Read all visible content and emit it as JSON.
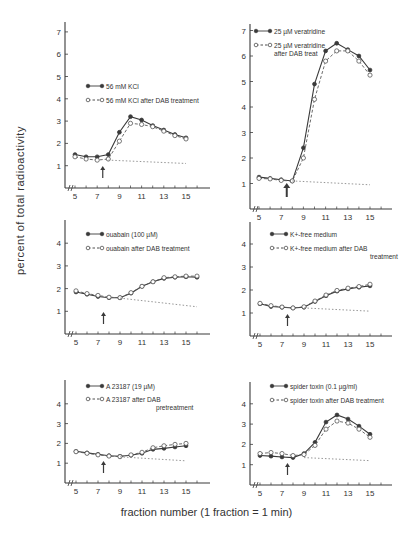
{
  "figure": {
    "ylabel": "percent of total radioactivity",
    "xlabel": "fraction number (1 fraction = 1 min)"
  },
  "chart_data": [
    {
      "type": "line",
      "id": "kcl",
      "panel": "top-left",
      "xlabel": "fraction number (1 fraction = 1 min)",
      "ylabel": "percent of total radioactivity",
      "xticks": [
        5,
        7,
        9,
        11,
        13,
        15
      ],
      "yticks": [
        1,
        2,
        3,
        4,
        5,
        6,
        7
      ],
      "ylim": [
        0,
        7
      ],
      "xlim": [
        4.5,
        17
      ],
      "stimulus_arrow_x": 7.5,
      "x": [
        5,
        6,
        7,
        8,
        9,
        10,
        11,
        12,
        13,
        14,
        15
      ],
      "series": [
        {
          "name": "56 mM KCl",
          "style": "solid-filled",
          "values": [
            1.5,
            1.4,
            1.4,
            1.5,
            2.5,
            3.2,
            3.05,
            2.8,
            2.6,
            2.4,
            2.25
          ]
        },
        {
          "name": "56 mM KCl after DAB treatment",
          "style": "dashed-open",
          "values": [
            1.4,
            1.3,
            1.25,
            1.3,
            2.1,
            2.9,
            2.85,
            2.75,
            2.55,
            2.35,
            2.2
          ]
        },
        {
          "name": "baseline",
          "style": "dotted",
          "points": [
            [
              8,
              1.25
            ],
            [
              15,
              1.1
            ]
          ]
        }
      ],
      "legend": [
        "56 mM KCl",
        "56 mM KCl after DAB treatment"
      ]
    },
    {
      "type": "line",
      "id": "veratridine",
      "panel": "top-right",
      "xticks": [
        5,
        7,
        9,
        11,
        13,
        15
      ],
      "yticks": [
        1,
        2,
        3,
        4,
        5,
        6,
        7
      ],
      "ylim": [
        0,
        7
      ],
      "xlim": [
        4.5,
        17
      ],
      "stimulus_arrow_x": 7.5,
      "x": [
        5,
        6,
        7,
        8,
        9,
        10,
        11,
        12,
        13,
        14,
        15
      ],
      "series": [
        {
          "name": "25 µM veratridine",
          "style": "solid-filled",
          "values": [
            1.25,
            1.2,
            1.15,
            1.1,
            2.4,
            4.9,
            6.2,
            6.5,
            6.25,
            6.0,
            5.45
          ]
        },
        {
          "name": "25 µM veratridine after DAB treat",
          "style": "dashed-open",
          "values": [
            1.2,
            1.18,
            1.12,
            1.1,
            2.0,
            4.3,
            5.8,
            6.2,
            6.2,
            5.8,
            5.25
          ]
        },
        {
          "name": "baseline",
          "style": "dotted",
          "points": [
            [
              8,
              1.1
            ],
            [
              15,
              0.95
            ]
          ]
        }
      ],
      "legend": [
        "25 µM veratridine",
        "25 µM veratridine after DAB treat"
      ]
    },
    {
      "type": "line",
      "id": "ouabain",
      "panel": "middle-left",
      "xticks": [
        5,
        7,
        9,
        11,
        13,
        15
      ],
      "yticks": [
        1,
        2,
        3,
        4
      ],
      "ylim": [
        0,
        5
      ],
      "xlim": [
        4.5,
        17
      ],
      "stimulus_arrow_x": 7.5,
      "x": [
        5,
        6,
        7,
        8,
        9,
        10,
        11,
        12,
        13,
        14,
        15,
        16
      ],
      "series": [
        {
          "name": "ouabain (100 µM)",
          "style": "solid-filled",
          "values": [
            1.85,
            1.75,
            1.65,
            1.6,
            1.6,
            1.8,
            2.1,
            2.3,
            2.45,
            2.5,
            2.52,
            2.5
          ]
        },
        {
          "name": "ouabain after DAB treatment",
          "style": "dashed-open",
          "values": [
            1.9,
            1.78,
            1.7,
            1.62,
            1.6,
            1.82,
            2.1,
            2.3,
            2.48,
            2.52,
            2.55,
            2.55
          ]
        },
        {
          "name": "baseline",
          "style": "dotted",
          "points": [
            [
              9,
              1.58
            ],
            [
              16,
              1.2
            ]
          ]
        }
      ],
      "legend": [
        "ouabain (100 µM)",
        "ouabain after DAB treatment"
      ]
    },
    {
      "type": "line",
      "id": "k-free",
      "panel": "middle-right",
      "xticks": [
        5,
        7,
        9,
        11,
        13,
        15
      ],
      "yticks": [
        1,
        2,
        3,
        4
      ],
      "ylim": [
        0,
        5
      ],
      "xlim": [
        4.5,
        17
      ],
      "stimulus_arrow_x": 7.5,
      "x": [
        5,
        6,
        7,
        8,
        9,
        10,
        11,
        12,
        13,
        14,
        15
      ],
      "series": [
        {
          "name": "K+-free medium",
          "style": "solid-filled",
          "values": [
            1.4,
            1.28,
            1.25,
            1.22,
            1.25,
            1.5,
            1.75,
            1.95,
            2.05,
            2.12,
            2.18
          ]
        },
        {
          "name": "K+-free medium after DAB treatment",
          "style": "dashed-open",
          "values": [
            1.42,
            1.32,
            1.26,
            1.22,
            1.27,
            1.52,
            1.78,
            1.98,
            2.08,
            2.15,
            2.25
          ]
        },
        {
          "name": "baseline",
          "style": "dotted",
          "points": [
            [
              9,
              1.22
            ],
            [
              15,
              1.08
            ]
          ]
        }
      ],
      "legend": [
        "K+-free medium",
        "K+-free medium after DAB treatment"
      ]
    },
    {
      "type": "line",
      "id": "a23187",
      "panel": "bottom-left",
      "xticks": [
        5,
        7,
        9,
        11,
        13,
        15
      ],
      "yticks": [
        1,
        2,
        3,
        4
      ],
      "ylim": [
        0,
        5
      ],
      "xlim": [
        4.5,
        17
      ],
      "stimulus_arrow_x": 7.5,
      "x": [
        5,
        6,
        7,
        8,
        9,
        10,
        11,
        12,
        13,
        14,
        15
      ],
      "series": [
        {
          "name": "A 23187 (19 µM)",
          "style": "solid-filled",
          "values": [
            1.6,
            1.52,
            1.45,
            1.38,
            1.35,
            1.4,
            1.5,
            1.7,
            1.75,
            1.82,
            1.88
          ]
        },
        {
          "name": "A 23187 after DAB pretreatment",
          "style": "dashed-open",
          "values": [
            1.58,
            1.5,
            1.42,
            1.36,
            1.33,
            1.42,
            1.55,
            1.78,
            1.88,
            1.95,
            2.0
          ]
        },
        {
          "name": "baseline",
          "style": "dotted",
          "points": [
            [
              9,
              1.32
            ],
            [
              15,
              1.12
            ]
          ]
        }
      ],
      "legend": [
        "A 23187 (19 µM)",
        "A 23187 after DAB pretreatment"
      ]
    },
    {
      "type": "line",
      "id": "spider-toxin",
      "panel": "bottom-right",
      "xticks": [
        5,
        7,
        9,
        11,
        13,
        15
      ],
      "yticks": [
        1,
        2,
        3,
        4
      ],
      "ylim": [
        0,
        5
      ],
      "xlim": [
        4.5,
        17
      ],
      "stimulus_arrow_x": 7.5,
      "x": [
        5,
        6,
        7,
        8,
        9,
        10,
        11,
        12,
        13,
        14,
        15
      ],
      "series": [
        {
          "name": "spider toxin (0.1 µg/ml)",
          "style": "solid-filled",
          "values": [
            1.45,
            1.42,
            1.38,
            1.35,
            1.55,
            2.1,
            3.1,
            3.45,
            3.25,
            2.9,
            2.5
          ]
        },
        {
          "name": "spider toxin after DAB treatment",
          "style": "dashed-open",
          "values": [
            1.55,
            1.6,
            1.55,
            1.45,
            1.5,
            1.95,
            2.75,
            3.15,
            3.05,
            2.75,
            2.35
          ]
        },
        {
          "name": "baseline",
          "style": "dotted",
          "points": [
            [
              9,
              1.35
            ],
            [
              15,
              1.2
            ]
          ]
        }
      ],
      "legend": [
        "spider toxin (0.1 µg/ml)",
        "spider toxin after DAB treatment"
      ]
    }
  ],
  "panels_layout": [
    {
      "x0": 65,
      "y0": 188,
      "ppx": 11.1,
      "ppy": 22.3,
      "x5": 75,
      "ytop": 22,
      "xend": 210,
      "legend": {
        "x": 88,
        "y": 86,
        "dy": 14
      }
    },
    {
      "x0": 250,
      "y0": 209,
      "ppx": 11.1,
      "ppy": 25.5,
      "x5": 259,
      "ytop": 24,
      "xend": 392,
      "legend": {
        "x": 256,
        "y": 31,
        "dy": 14
      }
    },
    {
      "x0": 65,
      "y0": 334,
      "ppx": 11.0,
      "ppy": 22.7,
      "x5": 76,
      "ytop": 220,
      "xend": 210,
      "legend": {
        "x": 88,
        "y": 234,
        "dy": 14
      }
    },
    {
      "x0": 250,
      "y0": 336,
      "ppx": 11.0,
      "ppy": 23.0,
      "x5": 260,
      "ytop": 222,
      "xend": 392,
      "legend": {
        "x": 272,
        "y": 234,
        "dy": 14
      }
    },
    {
      "x0": 65,
      "y0": 483,
      "ppx": 11.0,
      "ppy": 19.8,
      "x5": 76,
      "ytop": 380,
      "xend": 210,
      "legend": {
        "x": 88,
        "y": 386,
        "dy": 13
      }
    },
    {
      "x0": 250,
      "y0": 485,
      "ppx": 11.0,
      "ppy": 20.3,
      "x5": 260,
      "ytop": 382,
      "xend": 392,
      "legend": {
        "x": 272,
        "y": 386,
        "dy": 14
      }
    }
  ]
}
